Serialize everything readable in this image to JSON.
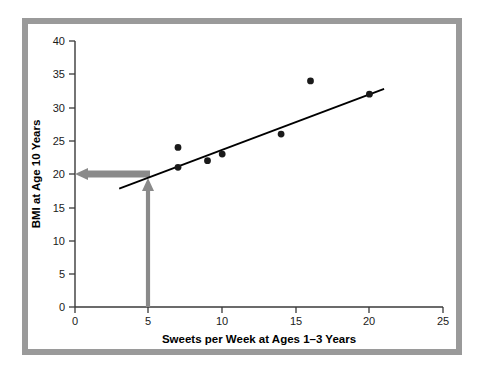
{
  "figure": {
    "frame_color": "#9a9a9a",
    "background": "#ffffff"
  },
  "chart_data": {
    "type": "scatter",
    "title": "",
    "xlabel": "Sweets per Week at Ages 1–3 Years",
    "ylabel": "BMI at Age 10 Years",
    "xlim": [
      0,
      25
    ],
    "ylim": [
      0,
      40
    ],
    "xticks": [
      0,
      5,
      10,
      15,
      20,
      25
    ],
    "yticks": [
      0,
      5,
      10,
      15,
      20,
      25,
      30,
      35,
      40
    ],
    "xtick_labels": [
      "0",
      "5",
      "10",
      "15",
      "20",
      "25"
    ],
    "ytick_labels": [
      "0",
      "5",
      "10",
      "15",
      "20",
      "25",
      "30",
      "35",
      "40"
    ],
    "grid": false,
    "legend": "none",
    "point_color": "#1a1a1a",
    "points": [
      {
        "x": 7,
        "y": 24
      },
      {
        "x": 7,
        "y": 21
      },
      {
        "x": 9,
        "y": 22
      },
      {
        "x": 10,
        "y": 23
      },
      {
        "x": 14,
        "y": 26
      },
      {
        "x": 16,
        "y": 34
      },
      {
        "x": 20,
        "y": 32
      }
    ],
    "series": [
      {
        "name": "Observations",
        "x": [
          7,
          7,
          9,
          10,
          14,
          16,
          20
        ],
        "values": [
          24,
          21,
          22,
          23,
          26,
          34,
          32
        ]
      }
    ],
    "trendline": {
      "name": "Regression line",
      "color": "#000000",
      "x_start": 3.0,
      "y_start": 17.8,
      "x_end": 21.0,
      "y_end": 32.8
    },
    "annotations": [
      {
        "name": "vertical-prediction-arrow",
        "color": "#8a8a8a",
        "direction": "up",
        "x": 5,
        "y_start": 0,
        "y_end": 20,
        "label": ""
      },
      {
        "name": "horizontal-prediction-arrow",
        "color": "#8a8a8a",
        "direction": "left",
        "y": 20,
        "x_start": 5,
        "x_end": 0,
        "label": ""
      }
    ]
  }
}
